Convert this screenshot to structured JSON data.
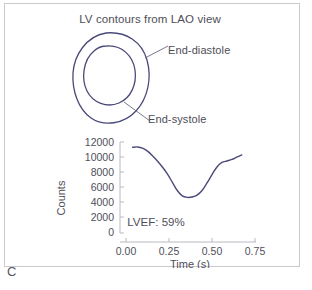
{
  "panel": {
    "letter": "C",
    "title": "LV contours from LAO view",
    "border_color": "#c9c9cf",
    "background_color": "#ffffff",
    "text_color": "#4e4e58"
  },
  "contours": {
    "line_color": "#4a4a7a",
    "leader_color": "#6a6a80",
    "items": [
      {
        "name": "End-diastole",
        "label": "End-diastole"
      },
      {
        "name": "End-systole",
        "label": "End-systole"
      }
    ]
  },
  "annotations": {
    "lvef_label": "LVEF: 59%",
    "lvef_value": 59,
    "lvef_units": "%"
  },
  "chart_data": {
    "type": "line",
    "title": "",
    "xlabel": "Time (s)",
    "ylabel": "Counts",
    "xlim": [
      0.0,
      0.78
    ],
    "ylim": [
      0,
      12000
    ],
    "xticks": [
      0.0,
      0.25,
      0.5,
      0.75
    ],
    "xtick_labels": [
      "0.00",
      "0.25",
      "0.50",
      "0.75"
    ],
    "yticks": [
      0,
      2000,
      4000,
      6000,
      8000,
      10000,
      12000
    ],
    "ytick_labels": [
      "0",
      "2000",
      "4000",
      "6000",
      "8000",
      "10000",
      "12000"
    ],
    "grid": false,
    "legend": "none",
    "line_color": "#4a4a7a",
    "axis_color": "#b9b9c2",
    "series": [
      {
        "name": "LV time-activity curve",
        "x": [
          0.04,
          0.07,
          0.1,
          0.13,
          0.16,
          0.19,
          0.22,
          0.25,
          0.28,
          0.31,
          0.34,
          0.37,
          0.4,
          0.43,
          0.46,
          0.49,
          0.52,
          0.55,
          0.58,
          0.61,
          0.64,
          0.67,
          0.7
        ],
        "values": [
          11300,
          11350,
          11200,
          10800,
          10200,
          9500,
          8700,
          7800,
          6700,
          5600,
          4900,
          4700,
          4750,
          5000,
          5600,
          6600,
          7700,
          8700,
          9300,
          9500,
          9700,
          10000,
          10300
        ]
      }
    ],
    "annotations": [
      {
        "text": "LVEF: 59%",
        "x": 0.3,
        "y": 1500
      }
    ]
  }
}
